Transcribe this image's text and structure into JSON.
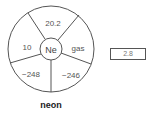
{
  "element": {
    "symbol": "Ne",
    "name": "neon",
    "segments": {
      "top": "20.2",
      "upper_left": "10",
      "upper_right": "gas",
      "lower_left": "−248",
      "lower_right": "−246"
    }
  },
  "answer_box": {
    "value": "2.8"
  },
  "colors": {
    "stroke": "#555555",
    "text": "#555555"
  }
}
